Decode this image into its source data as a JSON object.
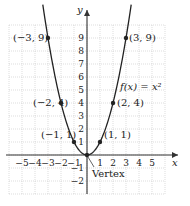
{
  "chart_data": {
    "type": "line",
    "title": "",
    "function_label": "f(x) = x²",
    "xlabel": "x",
    "ylabel": "y",
    "xlim": [
      -6,
      6
    ],
    "ylim": [
      -3,
      10
    ],
    "grid": true,
    "x_ticks": [
      -5,
      -4,
      -3,
      -2,
      -1,
      1,
      2,
      3,
      4,
      5
    ],
    "x_tick_labels": [
      "−5",
      "−4",
      "−3",
      "−2",
      "−1",
      "1",
      "2",
      "3",
      "4",
      "5"
    ],
    "y_ticks": [
      -2,
      -1,
      1,
      2,
      3,
      4,
      5,
      6,
      7,
      8,
      9
    ],
    "y_tick_labels": [
      "−2",
      "−1",
      "1",
      "2",
      "3",
      "4",
      "5",
      "6",
      "7",
      "8",
      "9"
    ],
    "series": [
      {
        "name": "f(x) = x^2",
        "x_range": [
          -3.4,
          3.4
        ],
        "equation": "y = x^2"
      }
    ],
    "points": [
      {
        "x": -3,
        "y": 9,
        "label": "(−3, 9)"
      },
      {
        "x": -2,
        "y": 4,
        "label": "(−2, 4)"
      },
      {
        "x": -1,
        "y": 1,
        "label": "(−1, 1)"
      },
      {
        "x": 0,
        "y": 0,
        "label": ""
      },
      {
        "x": 1,
        "y": 1,
        "label": "(1, 1)"
      },
      {
        "x": 2,
        "y": 4,
        "label": "(2, 4)"
      },
      {
        "x": 3,
        "y": 9,
        "label": "(3, 9)"
      }
    ],
    "annotations": [
      {
        "text": "Vertex",
        "x": 0,
        "y": 0
      }
    ]
  }
}
